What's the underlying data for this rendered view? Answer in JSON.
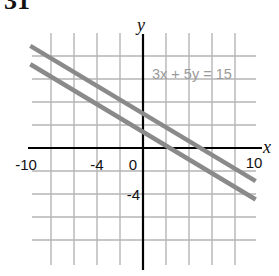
{
  "problem_number": "31",
  "chart_data": {
    "type": "line",
    "title": "",
    "xlabel": "x",
    "ylabel": "y",
    "xlim": [
      -10,
      10
    ],
    "ylim": [
      -10,
      10
    ],
    "grid": true,
    "grid_step": 2,
    "x_tick_labels": [
      {
        "value": -10,
        "label": "-10"
      },
      {
        "value": -4,
        "label": "-4"
      },
      {
        "value": 0,
        "label": "0"
      },
      {
        "value": 10,
        "label": "10"
      }
    ],
    "y_tick_labels": [
      {
        "value": -4,
        "label": "-4"
      }
    ],
    "annotations": [
      {
        "text": "3x + 5y = 15",
        "x": 1.5,
        "y": 6.5
      }
    ],
    "series": [
      {
        "name": "3x + 5y = 15",
        "x": [
          -10,
          10
        ],
        "y": [
          9,
          -3
        ],
        "color": "#8a8a8a"
      },
      {
        "name": "parallel line",
        "x": [
          -10,
          10
        ],
        "y": [
          7.4,
          -4.6
        ],
        "color": "#8a8a8a"
      }
    ]
  },
  "colors": {
    "axis": "#000000",
    "grid": "#b5b5b5",
    "line": "#8a8a8a",
    "label": "#111111",
    "annotation": "#9a9a9a"
  }
}
